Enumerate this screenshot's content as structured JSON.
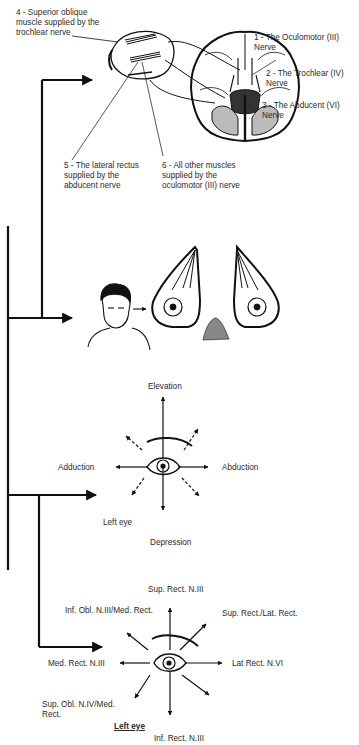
{
  "figure": {
    "panel_1": {
      "labels": {
        "l4": "4 - Superior oblique muscle supplied by the trochlear nerve",
        "l4_line1": "4 - Superior oblique",
        "l4_line2": "muscle supplied by the",
        "l4_line3": "trochlear nerve",
        "l1_line1": "1 - The Oculomotor (III)",
        "l1_line2": "Nerve",
        "l2_line1": "2 - The Trochlear (IV)",
        "l2_line2": "Nerve",
        "l3_line1": "3 - The Abducent (VI)",
        "l3_line2": "Nerve",
        "l5_line1": "5 - The lateral rectus",
        "l5_line2": "supplied by the",
        "l5_line3": "abducent nerve",
        "l6_line1": "6 - All other muscles",
        "l6_line2": "supplied by the",
        "l6_line3": "oculomotor (III) nerve"
      }
    },
    "panel_3": {
      "labels": {
        "up": "Elevation",
        "down": "Depression",
        "left": "Adduction",
        "right": "Abduction",
        "caption": "Left eye"
      }
    },
    "panel_4": {
      "labels": {
        "up": "Sup. Rect. N.III",
        "up_left": "Inf. Obl. N.III/Med. Rect.",
        "up_right": "Sup. Rect./Lat. Rect.",
        "left": "Med. Rect. N.III",
        "right": "Lat Rect. N.VI",
        "down_left_line1": "Sup. Obl. N.IV/Med.",
        "down_left_line2": "Rect.",
        "down": "Inf. Rect. N.III",
        "caption": "Left eye"
      }
    },
    "colors": {
      "ink": "#1a1a1a",
      "text": "#2a2a2a",
      "background": "#ffffff"
    }
  }
}
